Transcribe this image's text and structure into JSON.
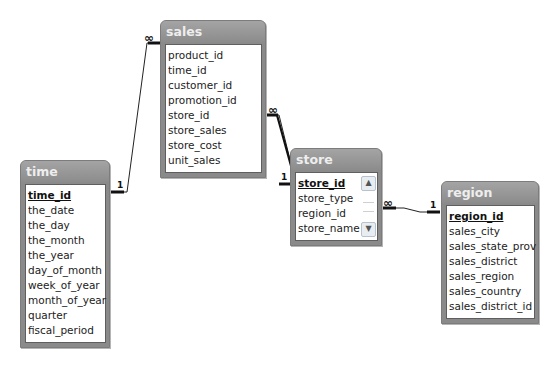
{
  "diagram": {
    "tables": {
      "sales": {
        "title": "sales",
        "fields": [
          "product_id",
          "time_id",
          "customer_id",
          "promotion_id",
          "store_id",
          "store_sales",
          "store_cost",
          "unit_sales"
        ]
      },
      "time": {
        "title": "time",
        "fields": [
          "time_id",
          "the_date",
          "the_day",
          "the_month",
          "the_year",
          "day_of_month",
          "week_of_year",
          "month_of_year",
          "quarter",
          "fiscal_period"
        ],
        "primary_key": "time_id"
      },
      "store": {
        "title": "store",
        "fields": [
          "store_id",
          "store_type",
          "region_id",
          "store_name"
        ],
        "primary_key": "store_id",
        "scrollbar": {
          "up_icon": "chevron-up-icon",
          "down_icon": "chevron-down-icon"
        }
      },
      "region": {
        "title": "region",
        "fields": [
          "region_id",
          "sales_city",
          "sales_state_prov",
          "sales_district",
          "sales_region",
          "sales_country",
          "sales_district_id"
        ],
        "primary_key": "region_id"
      }
    },
    "relationships": [
      {
        "from": "time",
        "to": "sales",
        "one_label": "1",
        "many_label": "∞"
      },
      {
        "from": "store",
        "to": "sales",
        "one_label": "1",
        "many_label": "∞"
      },
      {
        "from": "region",
        "to": "store",
        "one_label": "1",
        "many_label": "∞"
      }
    ],
    "colors": {
      "title_bar": "#8c8c8c",
      "title_text": "#eeeeee",
      "line": "#111111"
    }
  }
}
